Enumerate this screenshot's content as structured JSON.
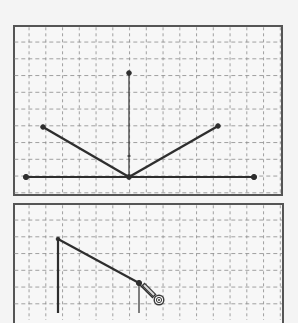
{
  "colors": {
    "background": "#f4f4f4",
    "panel_fill": "#f7f7f7",
    "panel_border": "#555555",
    "grid_line": "#8a8a8a",
    "stroke": "#2e2e2e"
  },
  "top_panel": {
    "grid": {
      "cols": 16,
      "rows": 10
    },
    "points": {
      "baseline_left": [
        26,
        177
      ],
      "baseline_right": [
        254,
        177
      ],
      "vertex": [
        129,
        177
      ],
      "vertical_top": [
        129,
        73
      ],
      "left_arm_end": [
        43,
        127
      ],
      "right_arm_end": [
        218,
        126
      ]
    },
    "vertical_tick_y": 156
  },
  "bottom_panel": {
    "points": {
      "left_top": [
        58,
        239
      ],
      "junction": [
        139,
        283
      ],
      "pencil_tip": [
        152,
        298
      ],
      "target_cursor": [
        159,
        300
      ]
    }
  }
}
